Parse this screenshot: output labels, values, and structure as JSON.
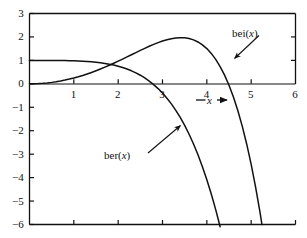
{
  "figure": {
    "background_color": "#ffffff",
    "ink_color": "#111111"
  },
  "chart_data": {
    "type": "line",
    "title": "",
    "subtitle": "",
    "xlabel": "x",
    "xlabel_decorated": "— x ➡",
    "ylabel": "",
    "xlim": [
      0,
      6
    ],
    "ylim": [
      -6,
      3
    ],
    "xticks": [
      0,
      1,
      2,
      3,
      4,
      5,
      6
    ],
    "xtick_labels": [
      "",
      "1",
      "2",
      "3",
      "4",
      "5",
      "6"
    ],
    "yticks": [
      3,
      2,
      1,
      0,
      -1,
      -2,
      -3,
      -4,
      -5,
      -6
    ],
    "ytick_labels": [
      "3",
      "2",
      "1",
      "0",
      "−1",
      "−2",
      "−3",
      "−4",
      "−5",
      "−6"
    ],
    "grid": false,
    "legend_position": "inline-annotations",
    "frame": "box-left-bottom-top-right",
    "x": [
      0.0,
      0.1,
      0.2,
      0.3,
      0.4,
      0.5,
      0.6,
      0.7,
      0.8,
      0.9,
      1.0,
      1.1,
      1.2,
      1.3,
      1.4,
      1.5,
      1.6,
      1.7,
      1.8,
      1.9,
      2.0,
      2.1,
      2.2,
      2.3,
      2.4,
      2.5,
      2.6,
      2.7,
      2.8,
      2.9,
      3.0,
      3.1,
      3.2,
      3.3,
      3.4,
      3.5,
      3.6,
      3.7,
      3.8,
      3.9,
      4.0,
      4.1,
      4.2,
      4.3,
      4.4,
      4.5,
      4.6,
      4.7,
      4.8,
      4.9,
      5.0,
      5.1,
      5.2,
      5.3,
      5.4,
      5.5,
      5.6,
      5.7,
      5.8,
      5.9,
      6.0
    ],
    "series": [
      {
        "name": "ber(x)",
        "label": "ber(x)",
        "color": "#111111",
        "values": [
          1.0,
          1.0,
          1.0,
          0.99987,
          0.99956,
          0.99902,
          0.99798,
          0.99625,
          0.9936,
          0.98981,
          0.98438,
          0.9772,
          0.96791,
          0.95606,
          0.94116,
          0.92263,
          0.89987,
          0.87216,
          0.83878,
          0.79895,
          0.75173,
          0.69614,
          0.63112,
          0.55545,
          0.46785,
          0.3669,
          0.25112,
          0.1189,
          -0.03155,
          -0.20215,
          -0.39499,
          -0.61223,
          -0.85622,
          -1.1294,
          -1.43434,
          -1.77376,
          -2.15047,
          -2.56741,
          -3.02766,
          -3.5344,
          -4.09098,
          -4.70085,
          -5.3676,
          -6.09494,
          -6.88672,
          -7.74688,
          -8.67951,
          -9.68883,
          -10.77916,
          -11.95496,
          -13.22078,
          -14.58132,
          -16.04136,
          -17.6058,
          -19.27966,
          -21.06805,
          -22.97619,
          -25.00937,
          -27.17302,
          -29.47262,
          -31.91374
        ]
      },
      {
        "name": "bei(x)",
        "label": "bei(x)",
        "color": "#111111",
        "values": [
          0.0,
          0.0025,
          0.01,
          0.0225,
          0.04,
          0.0625,
          0.08999,
          0.12247,
          0.15993,
          0.20234,
          0.24967,
          0.30186,
          0.35884,
          0.4205,
          0.4867,
          0.55728,
          0.63201,
          0.71063,
          0.79281,
          0.87818,
          0.96627,
          1.05656,
          1.14842,
          1.24112,
          1.33381,
          1.42554,
          1.51519,
          1.6015,
          1.68306,
          1.75828,
          1.82538,
          1.88239,
          1.92714,
          1.95721,
          1.96998,
          1.96256,
          1.93181,
          1.8743,
          1.78631,
          1.66383,
          1.50254,
          1.29778,
          1.04456,
          0.73755,
          0.37103,
          -0.06107,
          -0.56508,
          -1.14755,
          -1.81528,
          -2.57534,
          -3.43501,
          -4.4018,
          -5.48344,
          -6.68785,
          -8.0231,
          -9.49741,
          -11.11913,
          -12.89667,
          -14.83851,
          -16.95312,
          -19.24895
        ]
      }
    ],
    "annotations": [
      {
        "name": "bei-label",
        "text": "bei(x)",
        "text_prefix": "bei(",
        "text_var": "x",
        "text_suffix": ")",
        "points_to_x": 4.6,
        "points_to_y": 1.45
      },
      {
        "name": "ber-label",
        "text": "ber(x)",
        "text_prefix": "ber(",
        "text_var": "x",
        "text_suffix": ")",
        "points_to_x": 3.45,
        "points_to_y": -1.62
      }
    ],
    "features": {
      "bei_peak_x": 3.4,
      "bei_peak_y": 1.97,
      "ber_zero_x": 2.84,
      "bei_zero_x": 4.49,
      "curves_cross_x": 1.9,
      "curves_cross_y": 0.84
    }
  },
  "axis_labels": {
    "x": [
      {
        "value": "1"
      },
      {
        "value": "2"
      },
      {
        "value": "3"
      },
      {
        "value": "4"
      },
      {
        "value": "5"
      },
      {
        "value": "6"
      }
    ],
    "y": [
      {
        "value": "3"
      },
      {
        "value": "2"
      },
      {
        "value": "1"
      },
      {
        "value": "0"
      },
      {
        "value": "−1"
      },
      {
        "value": "−2"
      },
      {
        "value": "−3"
      },
      {
        "value": "−4"
      },
      {
        "value": "−5"
      },
      {
        "value": "−6"
      }
    ]
  },
  "axis_title": {
    "prefix_arrow": "—",
    "variable": "x",
    "suffix_arrow": "—"
  },
  "labels": {
    "bei_prefix": "bei(",
    "bei_var": "x",
    "bei_suffix": ")",
    "ber_prefix": "ber(",
    "ber_var": "x",
    "ber_suffix": ")"
  }
}
